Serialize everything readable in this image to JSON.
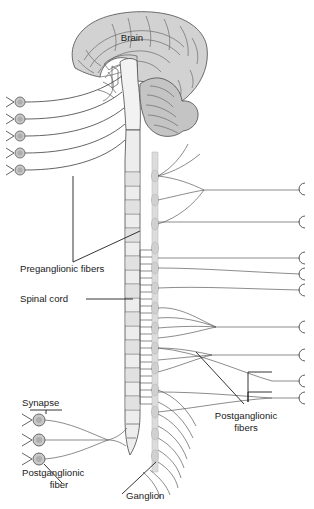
{
  "figure": {
    "width": 314,
    "height": 509,
    "background_color": "#ffffff"
  },
  "colors": {
    "brain_fill": "#d2d2d2",
    "cerebellum_fill": "#c4c4c4",
    "brainstem_fill": "#f2f2f2",
    "spinal_cord_fill": "#ededed",
    "spinal_cord_segment_fill": "#e4e4e4",
    "ganglion_chain_fill": "#dcdcdc",
    "ganglion_circle_fill": "#c8c8c8",
    "outline": "#4a4a4a",
    "fiber_line": "#5a5a5a",
    "label_text": "#1a1a1a",
    "leader_line": "#1e1e1e"
  },
  "labels": [
    {
      "id": "brain",
      "text": "Brain",
      "x": 132,
      "y": 41,
      "anchor": "middle",
      "has_leader": false
    },
    {
      "id": "preganglionic-fibers",
      "text": "Preganglionic fibers",
      "x": 20,
      "y": 272,
      "anchor": "start",
      "has_leader": true,
      "leader_kind": "wedge"
    },
    {
      "id": "spinal-cord",
      "text": "Spinal cord",
      "x": 20,
      "y": 302,
      "anchor": "start",
      "has_leader": true,
      "leader_kind": "line"
    },
    {
      "id": "synapse",
      "text": "Synapse",
      "x": 22,
      "y": 406,
      "anchor": "start",
      "has_leader": true,
      "leader_kind": "underline"
    },
    {
      "id": "postganglionic-fiber-left",
      "text": "Postganglionic",
      "text_line2": "fiber",
      "x": 22,
      "y": 476,
      "anchor": "start",
      "has_leader": true,
      "leader_kind": "line"
    },
    {
      "id": "ganglion",
      "text": "Ganglion",
      "x": 126,
      "y": 499,
      "anchor": "start",
      "has_leader": true,
      "leader_kind": "line"
    },
    {
      "id": "postganglionic-fibers-right",
      "text": "Postganglionic",
      "text_line2": "fibers",
      "x": 246,
      "y": 419,
      "anchor": "middle",
      "has_leader": true,
      "leader_kind": "bracket"
    }
  ],
  "structures": {
    "brain": {
      "name": "Brain (cerebrum, midsagittal)",
      "center_x": 128,
      "center_y": 65
    },
    "cerebellum": {
      "name": "Cerebellum",
      "center_x": 162,
      "center_y": 108
    },
    "brainstem": {
      "name": "Brainstem / medulla",
      "center_x": 128,
      "center_y": 110
    },
    "spinal_cord": {
      "name": "Spinal cord",
      "top_y": 130,
      "bottom_y": 455,
      "left_x": 126,
      "right_x": 142,
      "segment_count": 22
    },
    "sympathetic_chain": {
      "name": "Sympathetic ganglion chain",
      "x": 155,
      "top_y": 155,
      "bottom_y": 470,
      "ganglion_count": 14
    }
  },
  "left_neurons": {
    "upper_group_label": "Cranial preganglionic neurons",
    "count": 5,
    "circle_x": 20,
    "circle_radius": 5,
    "rows_y": [
      102,
      119,
      136,
      153,
      170
    ]
  },
  "bottom_left_neurons": {
    "label": "Sacral postganglionic neurons with synapses",
    "count": 3,
    "circle_x": 39,
    "circle_radius": 6,
    "rows_y": [
      420,
      440,
      459
    ],
    "convergence_x": 108,
    "convergence_y": 440
  },
  "right_terminals": {
    "label": "Postganglionic fiber terminals",
    "count": 9,
    "terminal_x": 300,
    "rows_y": [
      188,
      222,
      258,
      274,
      290,
      327,
      355,
      381,
      398
    ]
  },
  "fiber_groups": {
    "cranial_outflow": {
      "label": "Cranial preganglionic fibers to left ganglia",
      "count": 5
    },
    "thoracolumbar_outflow": {
      "label": "Preganglionic fibers from spinal cord to chain",
      "count": 22
    },
    "gray_rami": {
      "label": "Postganglionic fibers leaving chain",
      "count": 14
    }
  }
}
